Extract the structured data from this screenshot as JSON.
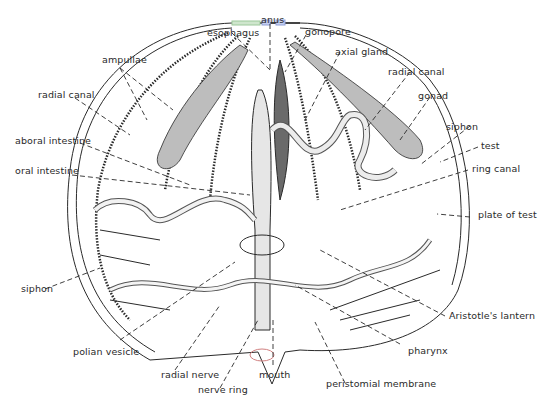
{
  "diagram": {
    "labels": {
      "esophagus": "esophagus",
      "anus": "anus",
      "gonopore": "gonopore",
      "ampullae": "ampullae",
      "axial_gland": "axial gland",
      "radial_canal_left": "radial canal",
      "radial_canal_right": "radial canal",
      "gonad": "gonad",
      "aboral_intestine": "aboral intestine",
      "siphon_right": "siphon",
      "test": "test",
      "oral_intestine": "oral intestine",
      "ring_canal": "ring canal",
      "plate_of_test": "plate of test",
      "siphon_left": "siphon",
      "aristotles_lantern": "Aristotle's lantern",
      "polian_vesicle": "polian vesicle",
      "pharynx": "pharynx",
      "radial_nerve": "radial nerve",
      "mouth": "mouth",
      "nerve_ring": "nerve ring",
      "peristomial_membrane": "peristomial membrane"
    },
    "colors": {
      "line": "#2a2a2a",
      "background": "#ffffff",
      "highlight_green": "#9cc89a",
      "highlight_blue": "#8fa0d8"
    }
  }
}
